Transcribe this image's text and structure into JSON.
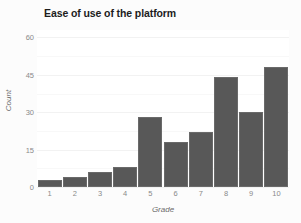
{
  "chart_data": {
    "type": "bar",
    "title": "Ease of use of the platform",
    "xlabel": "Grade",
    "ylabel": "Count",
    "categories": [
      "1",
      "2",
      "3",
      "4",
      "5",
      "6",
      "7",
      "8",
      "9",
      "10"
    ],
    "values": [
      3,
      4,
      6,
      8,
      28,
      18,
      22,
      44,
      30,
      48
    ],
    "ylim": [
      0,
      63
    ],
    "yticks": [
      0,
      15,
      30,
      45,
      60
    ],
    "ytick_labels": [
      "0",
      "15",
      "30",
      "45",
      "60"
    ],
    "xtick_labels": [
      "1",
      "2",
      "3",
      "4",
      "5",
      "6",
      "7",
      "8",
      "9",
      "10"
    ],
    "grid": true,
    "grid_orientation": "horizontal",
    "legend": false,
    "legend_position": "none",
    "bar_color": "#585858",
    "panel_background": "#ffffff",
    "figure_background": "#fcfcfc",
    "gridline_color": "#f2f2f2",
    "axis_text_color": "#8a8a8a",
    "title_color": "#1d1d1d"
  }
}
